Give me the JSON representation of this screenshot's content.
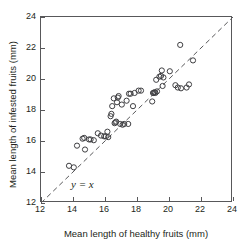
{
  "chart_data": {
    "type": "scatter",
    "title": "",
    "xlabel": "Mean length of healthy fruits (mm)",
    "ylabel": "Mean length of infested fruits (mm)",
    "xlim": [
      12,
      24
    ],
    "ylim": [
      12,
      24
    ],
    "xticks": [
      12,
      14,
      16,
      18,
      20,
      22,
      24
    ],
    "yticks": [
      12,
      14,
      16,
      18,
      20,
      22,
      24
    ],
    "xtick_labels": [
      "12",
      "14",
      "16",
      "18",
      "20",
      "22",
      "24"
    ],
    "ytick_labels": [
      "12",
      "14",
      "16",
      "18",
      "20",
      "22",
      "24"
    ],
    "grid": false,
    "legend": null,
    "marker": "open-circle",
    "marker_color": "#3f3f42",
    "frame_color": "#58585a",
    "annotations": [
      {
        "text": "y = x",
        "x": 13.6,
        "y": 12.9,
        "style": "italic",
        "describes": "reference-line"
      }
    ],
    "reference_line": {
      "name": "identity",
      "label": "y = x",
      "style": "dashed",
      "from": [
        12,
        12
      ],
      "to": [
        24,
        24
      ]
    },
    "points": [
      [
        13.75,
        14.4
      ],
      [
        14.05,
        14.3
      ],
      [
        14.25,
        15.7
      ],
      [
        14.6,
        16.15
      ],
      [
        14.7,
        16.2
      ],
      [
        14.75,
        15.45
      ],
      [
        15.0,
        16.1
      ],
      [
        15.1,
        16.1
      ],
      [
        15.3,
        16.05
      ],
      [
        15.55,
        16.5
      ],
      [
        15.75,
        16.35
      ],
      [
        15.95,
        16.3
      ],
      [
        16.05,
        16.3
      ],
      [
        16.15,
        16.6
      ],
      [
        16.2,
        16.25
      ],
      [
        16.35,
        17.6
      ],
      [
        16.4,
        17.75
      ],
      [
        16.45,
        18.25
      ],
      [
        16.55,
        18.75
      ],
      [
        16.6,
        17.15
      ],
      [
        16.65,
        17.2
      ],
      [
        16.7,
        17.25
      ],
      [
        16.75,
        18.5
      ],
      [
        16.8,
        18.8
      ],
      [
        16.85,
        18.9
      ],
      [
        16.95,
        17.1
      ],
      [
        17.05,
        18.35
      ],
      [
        17.1,
        17.05
      ],
      [
        17.2,
        17.1
      ],
      [
        17.35,
        18.6
      ],
      [
        17.45,
        17.1
      ],
      [
        17.5,
        19.05
      ],
      [
        17.6,
        19.05
      ],
      [
        17.75,
        18.25
      ],
      [
        17.85,
        19.1
      ],
      [
        18.1,
        19.25
      ],
      [
        18.25,
        19.25
      ],
      [
        18.95,
        18.55
      ],
      [
        19.0,
        19.1
      ],
      [
        19.05,
        19.1
      ],
      [
        19.1,
        19.15
      ],
      [
        19.15,
        19.1
      ],
      [
        19.2,
        19.95
      ],
      [
        19.25,
        19.2
      ],
      [
        19.4,
        20.15
      ],
      [
        19.5,
        20.2
      ],
      [
        19.55,
        20.55
      ],
      [
        19.6,
        19.55
      ],
      [
        19.65,
        20.1
      ],
      [
        20.05,
        20.5
      ],
      [
        20.4,
        19.6
      ],
      [
        20.55,
        19.45
      ],
      [
        20.7,
        22.2
      ],
      [
        20.75,
        19.4
      ],
      [
        21.1,
        19.45
      ],
      [
        21.25,
        19.65
      ],
      [
        21.5,
        21.2
      ]
    ]
  }
}
